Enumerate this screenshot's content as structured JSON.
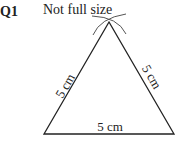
{
  "question": {
    "number": "Q1",
    "note": "Not full size"
  },
  "diagram": {
    "shape": "equilateral triangle",
    "construction": "compass arcs intersecting at apex",
    "sides": [
      {
        "id": "left",
        "label": "5 cm"
      },
      {
        "id": "right",
        "label": "5 cm"
      },
      {
        "id": "base",
        "label": "5 cm"
      }
    ],
    "vertices": {
      "apex": [
        109,
        22
      ],
      "bottom_left": [
        44,
        134
      ],
      "bottom_right": [
        174,
        134
      ]
    }
  }
}
